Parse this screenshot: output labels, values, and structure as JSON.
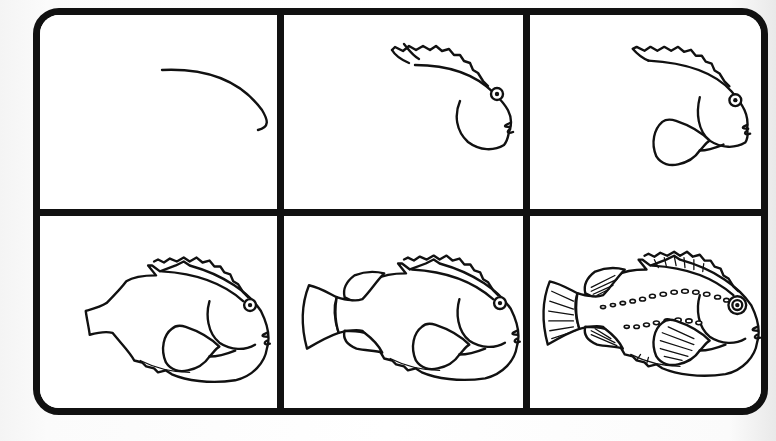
{
  "title": "How to draw a fish — 6-step tutorial",
  "colors": {
    "ink": "#111111",
    "paper": "#ffffff",
    "background": "#f7f7f7"
  },
  "layout": {
    "rows": 2,
    "columns": 3
  },
  "steps": [
    {
      "index": 1,
      "label": "Step 1",
      "description": "Curved head/back line"
    },
    {
      "index": 2,
      "label": "Step 2",
      "description": "Dorsal fin spikes, head with eye and mouth"
    },
    {
      "index": 3,
      "label": "Step 3",
      "description": "Pectoral fin added"
    },
    {
      "index": 4,
      "label": "Step 4",
      "description": "Body outline with tail stub and lower spikes"
    },
    {
      "index": 5,
      "label": "Step 5",
      "description": "Tail fin and upper/lower fins added"
    },
    {
      "index": 6,
      "label": "Step 6",
      "description": "Fin rays and dotted lateral-line pattern"
    }
  ]
}
